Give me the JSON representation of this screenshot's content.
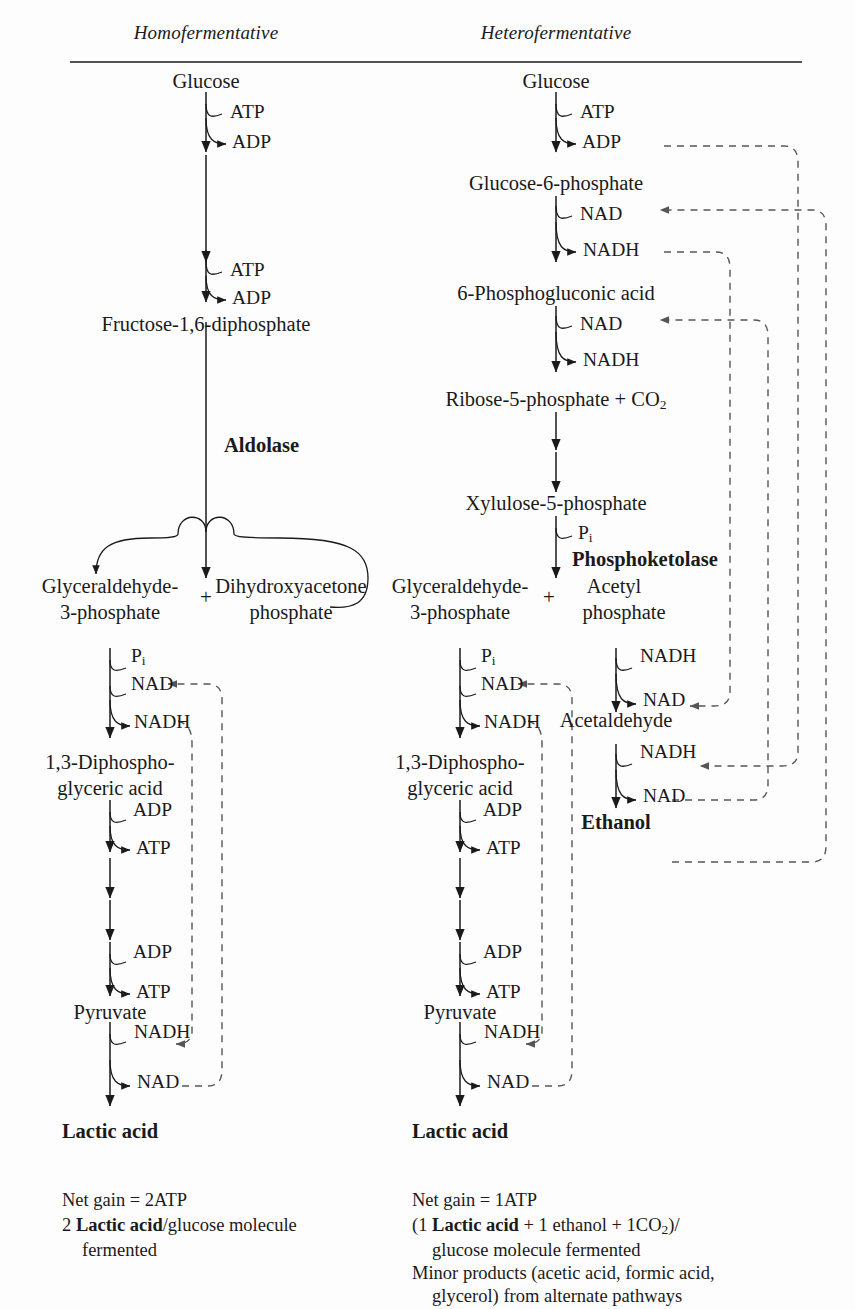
{
  "figure": {
    "headers": {
      "left": "Homofermentative",
      "right": "Heterofermentative"
    }
  },
  "left_pathway": {
    "name": "Homofermentative",
    "metabolites": [
      "Glucose",
      "Fructose-1,6-diphosphate",
      "Glyceraldehyde-",
      "3-phosphate",
      "Dihydroxyacetone",
      "phosphate",
      "1,3-Diphospho-",
      "glyceric acid",
      "Pyruvate",
      "Lactic acid"
    ],
    "enzyme": "Aldolase",
    "plus": "+",
    "cofactors": {
      "atp1_in": "ATP",
      "adp1_out": "ADP",
      "atp2_in": "ATP",
      "adp2_out": "ADP",
      "pi": "Pi",
      "pi_sub": "i",
      "pi_main": "P",
      "nad_in": "NAD",
      "nadh_out": "NADH",
      "adp3_in": "ADP",
      "atp3_out": "ATP",
      "adp4_in": "ADP",
      "atp4_out": "ATP",
      "nadh_in": "NADH",
      "nad_out": "NAD"
    },
    "summary": {
      "line1": "Net gain = 2ATP",
      "line2_prefix": "2 ",
      "line2_bold": "Lactic acid",
      "line2_suffix": "/glucose molecule",
      "line3": "fermented"
    }
  },
  "right_pathway": {
    "name": "Heterofermentative",
    "metabolites": [
      "Glucose",
      "Glucose-6-phosphate",
      "6-Phosphogluconic acid",
      "Ribose-5-phosphate + CO",
      "Xylulose-5-phosphate",
      "Glyceraldehyde-",
      "3-phosphate",
      "Acetyl",
      "phosphate",
      "Acetaldehyde",
      "Ethanol",
      "1,3-Diphospho-",
      "glyceric acid",
      "Pyruvate",
      "Lactic acid"
    ],
    "co2_sub": "2",
    "enzyme": "Phosphoketolase",
    "plus": "+",
    "cofactors": {
      "atp1_in": "ATP",
      "adp1_out": "ADP",
      "nad1_in": "NAD",
      "nadh1_out": "NADH",
      "nad2_in": "NAD",
      "nadh2_out": "NADH",
      "pi_main": "P",
      "pi_sub": "i",
      "g3p_pi_main": "P",
      "g3p_pi_sub": "i",
      "nad3_in": "NAD",
      "nadh3_out": "NADH",
      "adp2_in": "ADP",
      "atp2_out": "ATP",
      "adp3_in": "ADP",
      "atp3_out": "ATP",
      "nadh4_in": "NADH",
      "nad4_out": "NAD",
      "acp_nadh_in": "NADH",
      "acp_nad_out": "NAD",
      "ach_nadh_in": "NADH",
      "ach_nad_out": "NAD"
    },
    "summary": {
      "line1": "Net gain = 1ATP",
      "line2_a": "(1 ",
      "line2_bold": "Lactic acid",
      "line2_b": " + 1 ethanol + 1CO",
      "line2_sub": "2",
      "line2_c": ")/",
      "line3": "glucose molecule fermented",
      "line4": "Minor products (acetic acid, formic acid,",
      "line5": "glycerol) from alternate pathways"
    }
  },
  "style": {
    "ink": "#1a1a1a",
    "dash": "#555555",
    "background": "#fdfdfd"
  }
}
